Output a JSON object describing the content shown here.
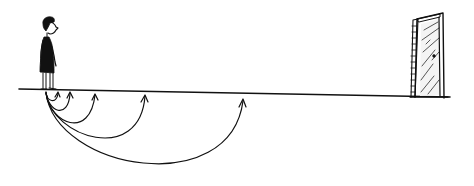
{
  "illustration": {
    "description": "Cartoon of a person standing on a ground line looking toward a distant door; multiple curved arrows loop from the person's feet to progressively farther points along the line, none reaching the door.",
    "colors": {
      "ink": "#111111",
      "background": "#ffffff",
      "door_shade": "#555555"
    },
    "ground_line": {
      "x1": 19,
      "y1": 89,
      "x2": 450,
      "y2": 97
    },
    "person": {
      "x": 45,
      "y_feet": 90,
      "facing": "right"
    },
    "door": {
      "x": 412,
      "y_top": 14,
      "y_bottom": 97,
      "state": "closed"
    },
    "arrows": [
      {
        "start_x": 46,
        "end_x": 58,
        "depth": 14
      },
      {
        "start_x": 46,
        "end_x": 70,
        "depth": 28
      },
      {
        "start_x": 46,
        "end_x": 95,
        "depth": 46
      },
      {
        "start_x": 46,
        "end_x": 145,
        "depth": 65
      },
      {
        "start_x": 46,
        "end_x": 243,
        "depth": 92
      }
    ]
  }
}
